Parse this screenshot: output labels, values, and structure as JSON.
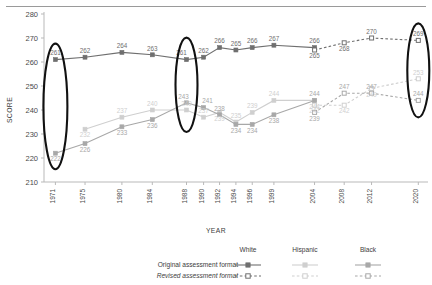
{
  "axes": {
    "ylabel": "SCORE",
    "xlabel": "YEAR",
    "yticks": [
      "280",
      "270",
      "260",
      "250",
      "240",
      "230",
      "220",
      "210"
    ],
    "ylim": [
      210,
      280
    ],
    "xticks": [
      "1971",
      "1975",
      "1980",
      "1984",
      "1988",
      "1990",
      "1992",
      "1994",
      "1996",
      "1999",
      "2004",
      "2008",
      "2012",
      "2020"
    ]
  },
  "legend": {
    "columns": [
      "White",
      "Hispanic",
      "Black"
    ],
    "rows": [
      "Original assessment format",
      "Revised assessment format"
    ]
  },
  "colors": {
    "white_series": "#6f6f6f",
    "hispanic_series": "#cfcfcf",
    "black_series": "#a8a8a8",
    "highlight_oval": "#111111",
    "axis": "#b9b9b9"
  },
  "chart_data": {
    "type": "line",
    "title": "",
    "xlabel": "YEAR",
    "ylabel": "SCORE",
    "ylim": [
      210,
      280
    ],
    "grid": false,
    "legend_position": "bottom",
    "categories": [
      "1971",
      "1975",
      "1980",
      "1984",
      "1988",
      "1990",
      "1992",
      "1994",
      "1996",
      "1999",
      "2004",
      "2008",
      "2012",
      "2020"
    ],
    "highlighted_years": [
      "1971",
      "1988",
      "2020"
    ],
    "series": [
      {
        "name": "White",
        "format": "Original assessment format",
        "style": "solid",
        "marker": "filled-square",
        "color": "#6f6f6f",
        "points": [
          {
            "year": "1971",
            "value": 261
          },
          {
            "year": "1975",
            "value": 262
          },
          {
            "year": "1980",
            "value": 264
          },
          {
            "year": "1984",
            "value": 263
          },
          {
            "year": "1988",
            "value": 261
          },
          {
            "year": "1990",
            "value": 262
          },
          {
            "year": "1992",
            "value": 266
          },
          {
            "year": "1994",
            "value": 265
          },
          {
            "year": "1996",
            "value": 266
          },
          {
            "year": "1999",
            "value": 267
          },
          {
            "year": "2004",
            "value": 266
          }
        ]
      },
      {
        "name": "White",
        "format": "Revised assessment format",
        "style": "dashed",
        "marker": "hollow-square",
        "color": "#6f6f6f",
        "points": [
          {
            "year": "2004",
            "value": 265
          },
          {
            "year": "2008",
            "value": 268
          },
          {
            "year": "2012",
            "value": 270
          },
          {
            "year": "2020",
            "value": 269
          }
        ]
      },
      {
        "name": "Hispanic",
        "format": "Original assessment format",
        "style": "solid",
        "marker": "filled-square",
        "color": "#cfcfcf",
        "points": [
          {
            "year": "1975",
            "value": 232
          },
          {
            "year": "1980",
            "value": 237
          },
          {
            "year": "1984",
            "value": 240
          },
          {
            "year": "1988",
            "value": 240
          },
          {
            "year": "1990",
            "value": 237
          },
          {
            "year": "1992",
            "value": 239
          },
          {
            "year": "1994",
            "value": 235
          },
          {
            "year": "1996",
            "value": 239
          },
          {
            "year": "1999",
            "value": 244
          },
          {
            "year": "2004",
            "value": 244
          }
        ]
      },
      {
        "name": "Hispanic",
        "format": "Revised assessment format",
        "style": "dashed",
        "marker": "hollow-square",
        "color": "#cfcfcf",
        "points": [
          {
            "year": "2004",
            "value": 242
          },
          {
            "year": "2008",
            "value": 242
          },
          {
            "year": "2012",
            "value": 249
          },
          {
            "year": "2020",
            "value": 253
          }
        ]
      },
      {
        "name": "Black",
        "format": "Original assessment format",
        "style": "solid",
        "marker": "filled-square",
        "color": "#a8a8a8",
        "points": [
          {
            "year": "1971",
            "value": 222
          },
          {
            "year": "1975",
            "value": 226
          },
          {
            "year": "1980",
            "value": 233
          },
          {
            "year": "1984",
            "value": 236
          },
          {
            "year": "1988",
            "value": 243
          },
          {
            "year": "1990",
            "value": 241
          },
          {
            "year": "1992",
            "value": 238
          },
          {
            "year": "1994",
            "value": 234
          },
          {
            "year": "1996",
            "value": 234
          },
          {
            "year": "1999",
            "value": 238
          },
          {
            "year": "2004",
            "value": 244
          }
        ]
      },
      {
        "name": "Black",
        "format": "Revised assessment format",
        "style": "dashed",
        "marker": "hollow-square",
        "color": "#a8a8a8",
        "points": [
          {
            "year": "2004",
            "value": 239
          },
          {
            "year": "2008",
            "value": 247
          },
          {
            "year": "2012",
            "value": 247
          },
          {
            "year": "2020",
            "value": 244
          }
        ]
      }
    ]
  }
}
